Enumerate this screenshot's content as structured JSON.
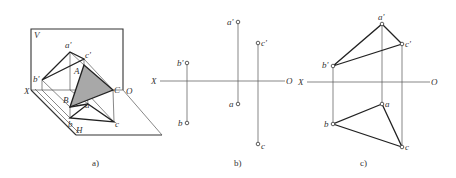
{
  "figure": {
    "panels": [
      {
        "id": "a",
        "caption": "a)",
        "description": "Pictorial view of triangle ABC in V/H projection planes",
        "labels": {
          "V": "V",
          "H": "H",
          "X": "X",
          "O": "O",
          "A": "A",
          "B": "B",
          "C": "C",
          "a_prime": "a'",
          "b_prime": "b'",
          "c_prime": "c'",
          "a": "a",
          "b": "b",
          "c": "c"
        },
        "shade_color": "#a8a8a8"
      },
      {
        "id": "b",
        "caption": "b)",
        "description": "Projections of points a, b, c on two-plane system (unconnected)",
        "labels": {
          "X": "X",
          "O": "O",
          "a_prime": "a'",
          "b_prime": "b'",
          "c_prime": "c'",
          "a": "a",
          "b": "b",
          "c": "c"
        }
      },
      {
        "id": "c",
        "caption": "c)",
        "description": "Projections of triangle abc and a'b'c' connected",
        "labels": {
          "X": "X",
          "O": "O",
          "a_prime": "a'",
          "b_prime": "b'",
          "c_prime": "c'",
          "a": "a",
          "b": "b",
          "c": "c"
        }
      }
    ]
  }
}
